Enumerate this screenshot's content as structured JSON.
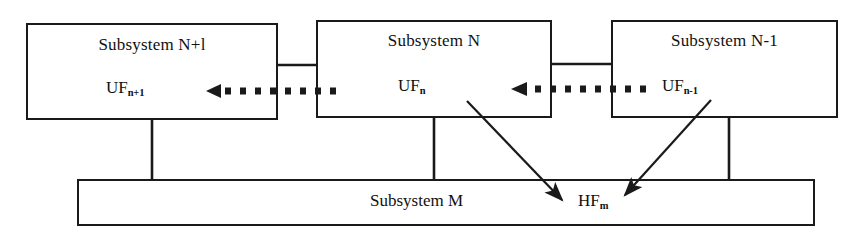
{
  "diagram": {
    "stroke_color": "#1a1a1a",
    "background_color": "#ffffff",
    "boxes": [
      {
        "id": "subsystem-n-plus-1",
        "title": "Subsystem N+l",
        "function_label": "UF",
        "function_sub": "n+1"
      },
      {
        "id": "subsystem-n",
        "title": "Subsystem N",
        "function_label": "UF",
        "function_sub": "n"
      },
      {
        "id": "subsystem-n-minus-1",
        "title": "Subsystem N-1",
        "function_label": "UF",
        "function_sub": "n-1"
      }
    ],
    "bottom_box": {
      "id": "subsystem-m",
      "title": "Subsystem M",
      "function_label": "HF",
      "function_sub": "m"
    },
    "connectors": {
      "horizontal_links": 2,
      "vertical_links": 3,
      "dashed_arrows": 2,
      "solid_arrows": 2
    }
  }
}
